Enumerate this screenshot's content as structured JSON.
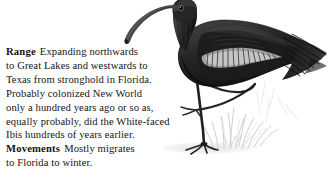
{
  "page": {
    "background_color": "#ffffff",
    "text_color": "#141414",
    "illustration_ink_color": "#1b1b1b"
  },
  "text_block": {
    "lines": [
      {
        "label": "Range",
        "text": "Expanding northwards"
      },
      {
        "label": "",
        "text": "to Great Lakes and westwards to"
      },
      {
        "label": "",
        "text": "Texas from stronghold in Florida."
      },
      {
        "label": "",
        "text": "Probably colonized New World"
      },
      {
        "label": "",
        "text": "only a hundred years ago or so as,"
      },
      {
        "label": "",
        "text": "equally probably, did the White-faced"
      },
      {
        "label": "",
        "text": "Ibis hundreds of years earlier."
      },
      {
        "label": "Movements",
        "text": "Mostly migrates"
      },
      {
        "label": "",
        "text": "to Florida to winter."
      }
    ],
    "headings": [
      "Range",
      "Movements"
    ],
    "full_text": "Range Expanding northwards to Great Lakes and westwards to Texas from stronghold in Florida. Probably colonized New World only a hundred years ago or so as, equally probably, did the White-faced Ibis hundreds of years earlier. Movements Mostly migrates to Florida to winter."
  },
  "illustration": {
    "subject": "glossy-ibis",
    "description": "Dark ibis standing on one leg, long decurved bill, other leg raised and folded, faint pencil grass at ground level",
    "body_color": "#232323",
    "dark_color": "#111111",
    "wing_highlight_color": "#b9b9b9",
    "grass_color": "#cfcfcf",
    "ground_color": "#e2e2e2"
  }
}
